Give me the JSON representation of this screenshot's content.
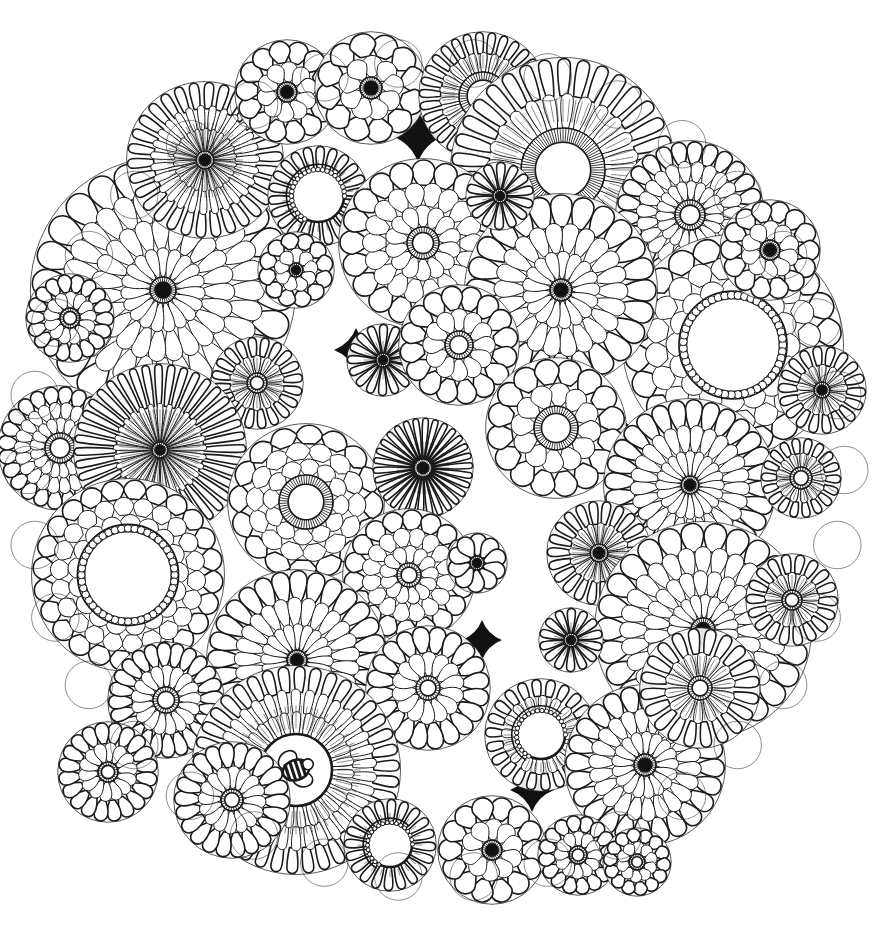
{
  "artwork": {
    "title": "Floral Mandala Coloring Page",
    "kind": "line-art-coloring-page",
    "subject": "circular mandala composed of overlapping stylized flowers",
    "canvas": {
      "width": 887,
      "height": 943
    },
    "background_color": "#ffffff",
    "ink_color": "#1a1a1a",
    "fill_color": "#ffffff",
    "dark_gap_color": "#111111",
    "stroke_width_thin": 1,
    "stroke_width_medium": 1.6,
    "stroke_width_bold": 2.6,
    "mandala": {
      "center_x": 436,
      "center_y": 470,
      "radius": 432,
      "edge_scallop_count": 34
    }
  },
  "palette": {
    "ink": "#1a1a1a",
    "paper": "#ffffff",
    "dark_center": "#111111",
    "shadow_gap": "#0d0d0d"
  },
  "flower_styles": {
    "daisy_dark_core": "many narrow petals, solid black center dot",
    "daisy_open_core": "many narrow petals, empty white center with hatched ring",
    "beaded_core": "rounded petals, white center ringed with small beads",
    "hatched_core": "petals with a striped / hatched annular center",
    "crescent": "partial ring of beads forming a moon shape",
    "rounded_bloom": "large rounded teardrop petals in two or three rows",
    "bee_center": "flower center containing a small striped bee"
  },
  "flowers": [
    {
      "id": "f01",
      "cx": 163,
      "cy": 290,
      "r": 132,
      "rows": 4,
      "petals": 26,
      "style": "daisy_dark_core",
      "core_r": 13,
      "core_fill": "dark",
      "petal_shape": "teardrop"
    },
    {
      "id": "f02",
      "cx": 205,
      "cy": 160,
      "r": 78,
      "rows": 3,
      "petals": 30,
      "style": "daisy_dark_core",
      "core_r": 9,
      "core_fill": "dark",
      "petal_shape": "narrow"
    },
    {
      "id": "f03",
      "cx": 287,
      "cy": 92,
      "r": 52,
      "rows": 2,
      "petals": 14,
      "style": "rounded_bloom",
      "core_r": 10,
      "core_fill": "dark",
      "petal_shape": "round"
    },
    {
      "id": "f04",
      "cx": 371,
      "cy": 88,
      "r": 56,
      "rows": 2,
      "petals": 12,
      "style": "rounded_bloom",
      "core_r": 11,
      "core_fill": "dark",
      "petal_shape": "round"
    },
    {
      "id": "f05",
      "cx": 483,
      "cy": 96,
      "r": 64,
      "rows": 2,
      "petals": 30,
      "style": "daisy_open_core",
      "core_r": 24,
      "core_fill": "open",
      "petal_shape": "narrow"
    },
    {
      "id": "f06",
      "cx": 563,
      "cy": 170,
      "r": 112,
      "rows": 2,
      "petals": 34,
      "style": "daisy_open_core",
      "core_r": 42,
      "core_fill": "open",
      "petal_shape": "long"
    },
    {
      "id": "f07",
      "cx": 690,
      "cy": 215,
      "r": 74,
      "rows": 3,
      "petals": 26,
      "style": "hatched_core",
      "core_r": 15,
      "core_fill": "open",
      "petal_shape": "teardrop"
    },
    {
      "id": "f08",
      "cx": 733,
      "cy": 345,
      "r": 110,
      "rows": 3,
      "petals": 22,
      "style": "beaded_core",
      "core_r": 47,
      "core_fill": "open",
      "petal_shape": "round"
    },
    {
      "id": "f09",
      "cx": 318,
      "cy": 196,
      "r": 50,
      "rows": 1,
      "petals": 22,
      "style": "crescent",
      "core_r": 26,
      "core_fill": "open",
      "petal_shape": "narrow"
    },
    {
      "id": "f10",
      "cx": 423,
      "cy": 243,
      "r": 84,
      "rows": 3,
      "petals": 20,
      "style": "hatched_core",
      "core_r": 16,
      "core_fill": "open",
      "petal_shape": "round"
    },
    {
      "id": "f11",
      "cx": 296,
      "cy": 270,
      "r": 38,
      "rows": 2,
      "petals": 12,
      "style": "daisy_dark_core",
      "core_r": 7,
      "core_fill": "dark",
      "petal_shape": "round"
    },
    {
      "id": "f12",
      "cx": 561,
      "cy": 290,
      "r": 96,
      "rows": 3,
      "petals": 24,
      "style": "daisy_dark_core",
      "core_r": 11,
      "core_fill": "dark",
      "petal_shape": "teardrop"
    },
    {
      "id": "f13",
      "cx": 257,
      "cy": 383,
      "r": 46,
      "rows": 2,
      "petals": 20,
      "style": "hatched_core",
      "core_r": 10,
      "core_fill": "open",
      "petal_shape": "narrow"
    },
    {
      "id": "f14",
      "cx": 383,
      "cy": 360,
      "r": 36,
      "rows": 1,
      "petals": 16,
      "style": "daisy_dark_core",
      "core_r": 7,
      "core_fill": "dark",
      "petal_shape": "narrow"
    },
    {
      "id": "f15",
      "cx": 459,
      "cy": 345,
      "r": 60,
      "rows": 2,
      "petals": 16,
      "style": "hatched_core",
      "core_r": 14,
      "core_fill": "open",
      "petal_shape": "round"
    },
    {
      "id": "f16",
      "cx": 556,
      "cy": 428,
      "r": 70,
      "rows": 2,
      "petals": 16,
      "style": "hatched_core",
      "core_r": 22,
      "core_fill": "open",
      "petal_shape": "round"
    },
    {
      "id": "f17",
      "cx": 690,
      "cy": 485,
      "r": 86,
      "rows": 3,
      "petals": 28,
      "style": "daisy_dark_core",
      "core_r": 9,
      "core_fill": "dark",
      "petal_shape": "teardrop"
    },
    {
      "id": "f18",
      "cx": 801,
      "cy": 478,
      "r": 40,
      "rows": 2,
      "petals": 18,
      "style": "hatched_core",
      "core_r": 11,
      "core_fill": "open",
      "petal_shape": "narrow"
    },
    {
      "id": "f19",
      "cx": 60,
      "cy": 448,
      "r": 62,
      "rows": 3,
      "petals": 24,
      "style": "hatched_core",
      "core_r": 15,
      "core_fill": "open",
      "petal_shape": "round"
    },
    {
      "id": "f20",
      "cx": 160,
      "cy": 450,
      "r": 86,
      "rows": 2,
      "petals": 40,
      "style": "daisy_dark_core",
      "core_r": 8,
      "core_fill": "dark",
      "petal_shape": "narrow"
    },
    {
      "id": "f21",
      "cx": 128,
      "cy": 575,
      "r": 96,
      "rows": 3,
      "petals": 24,
      "style": "beaded_core",
      "core_r": 44,
      "core_fill": "open",
      "petal_shape": "round"
    },
    {
      "id": "f22",
      "cx": 306,
      "cy": 502,
      "r": 78,
      "rows": 3,
      "petals": 16,
      "style": "hatched_core",
      "core_r": 27,
      "core_fill": "open",
      "petal_shape": "round"
    },
    {
      "id": "f23",
      "cx": 423,
      "cy": 468,
      "r": 50,
      "rows": 1,
      "petals": 30,
      "style": "daisy_dark_core",
      "core_r": 9,
      "core_fill": "dark",
      "petal_shape": "narrow"
    },
    {
      "id": "f24",
      "cx": 409,
      "cy": 575,
      "r": 66,
      "rows": 3,
      "petals": 18,
      "style": "hatched_core",
      "core_r": 12,
      "core_fill": "open",
      "petal_shape": "round"
    },
    {
      "id": "f25",
      "cx": 477,
      "cy": 563,
      "r": 30,
      "rows": 1,
      "petals": 10,
      "style": "daisy_dark_core",
      "core_r": 7,
      "core_fill": "dark",
      "petal_shape": "round"
    },
    {
      "id": "f26",
      "cx": 599,
      "cy": 553,
      "r": 52,
      "rows": 2,
      "petals": 22,
      "style": "daisy_dark_core",
      "core_r": 9,
      "core_fill": "dark",
      "petal_shape": "narrow"
    },
    {
      "id": "f27",
      "cx": 703,
      "cy": 630,
      "r": 108,
      "rows": 4,
      "petals": 26,
      "style": "daisy_dark_core",
      "core_r": 12,
      "core_fill": "dark",
      "petal_shape": "teardrop"
    },
    {
      "id": "f28",
      "cx": 571,
      "cy": 640,
      "r": 32,
      "rows": 1,
      "petals": 14,
      "style": "daisy_dark_core",
      "core_r": 7,
      "core_fill": "dark",
      "petal_shape": "narrow"
    },
    {
      "id": "f29",
      "cx": 297,
      "cy": 660,
      "r": 90,
      "rows": 3,
      "petals": 28,
      "style": "daisy_dark_core",
      "core_r": 10,
      "core_fill": "dark",
      "petal_shape": "teardrop"
    },
    {
      "id": "f30",
      "cx": 166,
      "cy": 700,
      "r": 58,
      "rows": 2,
      "petals": 24,
      "style": "hatched_core",
      "core_r": 13,
      "core_fill": "open",
      "petal_shape": "round"
    },
    {
      "id": "f31",
      "cx": 428,
      "cy": 688,
      "r": 62,
      "rows": 2,
      "petals": 20,
      "style": "hatched_core",
      "core_r": 12,
      "core_fill": "open",
      "petal_shape": "round"
    },
    {
      "id": "f32",
      "cx": 296,
      "cy": 770,
      "r": 104,
      "rows": 3,
      "petals": 38,
      "style": "bee_center",
      "core_r": 36,
      "core_fill": "open",
      "petal_shape": "long"
    },
    {
      "id": "f33",
      "cx": 541,
      "cy": 735,
      "r": 56,
      "rows": 2,
      "petals": 22,
      "style": "crescent",
      "core_r": 24,
      "core_fill": "open",
      "petal_shape": "narrow"
    },
    {
      "id": "f34",
      "cx": 645,
      "cy": 765,
      "r": 80,
      "rows": 3,
      "petals": 24,
      "style": "daisy_dark_core",
      "core_r": 11,
      "core_fill": "dark",
      "petal_shape": "teardrop"
    },
    {
      "id": "f35",
      "cx": 700,
      "cy": 688,
      "r": 60,
      "rows": 2,
      "petals": 20,
      "style": "hatched_core",
      "core_r": 12,
      "core_fill": "open",
      "petal_shape": "narrow"
    },
    {
      "id": "f36",
      "cx": 390,
      "cy": 845,
      "r": 46,
      "rows": 1,
      "petals": 20,
      "style": "crescent",
      "core_r": 22,
      "core_fill": "open",
      "petal_shape": "narrow"
    },
    {
      "id": "f37",
      "cx": 492,
      "cy": 850,
      "r": 54,
      "rows": 2,
      "petals": 14,
      "style": "daisy_dark_core",
      "core_r": 10,
      "core_fill": "dark",
      "petal_shape": "round"
    },
    {
      "id": "f38",
      "cx": 578,
      "cy": 855,
      "r": 40,
      "rows": 2,
      "petals": 16,
      "style": "hatched_core",
      "core_r": 9,
      "core_fill": "open",
      "petal_shape": "round"
    },
    {
      "id": "f39",
      "cx": 792,
      "cy": 600,
      "r": 46,
      "rows": 2,
      "petals": 18,
      "style": "hatched_core",
      "core_r": 10,
      "core_fill": "open",
      "petal_shape": "narrow"
    },
    {
      "id": "f40",
      "cx": 822,
      "cy": 390,
      "r": 44,
      "rows": 2,
      "petals": 18,
      "style": "daisy_dark_core",
      "core_r": 8,
      "core_fill": "dark",
      "petal_shape": "narrow"
    },
    {
      "id": "f41",
      "cx": 770,
      "cy": 250,
      "r": 50,
      "rows": 2,
      "petals": 14,
      "style": "rounded_bloom",
      "core_r": 10,
      "core_fill": "dark",
      "petal_shape": "round"
    },
    {
      "id": "f42",
      "cx": 70,
      "cy": 318,
      "r": 44,
      "rows": 2,
      "petals": 18,
      "style": "hatched_core",
      "core_r": 10,
      "core_fill": "open",
      "petal_shape": "round"
    },
    {
      "id": "f43",
      "cx": 232,
      "cy": 800,
      "r": 58,
      "rows": 2,
      "petals": 22,
      "style": "hatched_core",
      "core_r": 11,
      "core_fill": "open",
      "petal_shape": "round"
    },
    {
      "id": "f44",
      "cx": 500,
      "cy": 196,
      "r": 34,
      "rows": 1,
      "petals": 14,
      "style": "daisy_dark_core",
      "core_r": 7,
      "core_fill": "dark",
      "petal_shape": "narrow"
    },
    {
      "id": "f45",
      "cx": 637,
      "cy": 862,
      "r": 34,
      "rows": 2,
      "petals": 14,
      "style": "hatched_core",
      "core_r": 8,
      "core_fill": "open",
      "petal_shape": "round"
    },
    {
      "id": "f46",
      "cx": 108,
      "cy": 772,
      "r": 50,
      "rows": 2,
      "petals": 20,
      "style": "hatched_core",
      "core_r": 10,
      "core_fill": "open",
      "petal_shape": "round"
    }
  ],
  "dark_gaps": [
    {
      "cx": 418,
      "cy": 136,
      "r": 26
    },
    {
      "cx": 356,
      "cy": 350,
      "r": 22
    },
    {
      "cx": 250,
      "cy": 612,
      "r": 24
    },
    {
      "cx": 482,
      "cy": 640,
      "r": 20
    },
    {
      "cx": 618,
      "cy": 432,
      "r": 22
    },
    {
      "cx": 532,
      "cy": 790,
      "r": 22
    },
    {
      "cx": 644,
      "cy": 318,
      "r": 18
    },
    {
      "cx": 182,
      "cy": 368,
      "r": 18
    }
  ],
  "bee": {
    "present": true,
    "cx": 296,
    "cy": 770,
    "body_width": 26,
    "body_height": 18,
    "stripe_count": 4,
    "wing_count": 2,
    "description": "small striped bumblebee drawn inside the center of the lower-left large flower"
  },
  "labels": {
    "caption": ""
  }
}
